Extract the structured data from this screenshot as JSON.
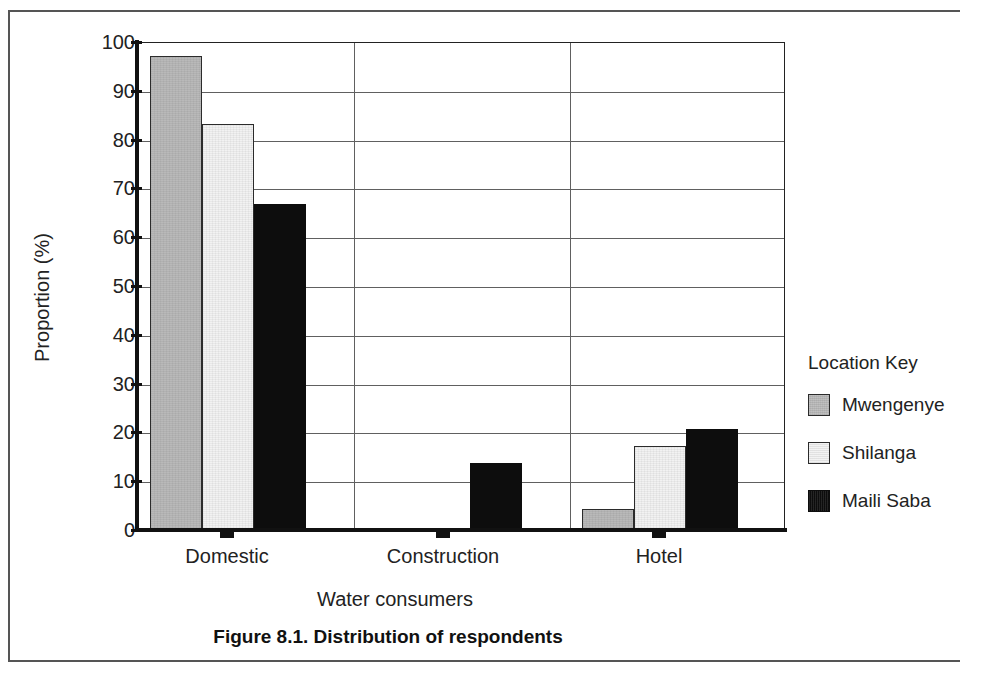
{
  "figure": {
    "caption": "Figure 8.1. Distribution of respondents"
  },
  "chart_data": {
    "type": "bar",
    "title": "",
    "xlabel": "Water consumers",
    "ylabel": "Proportion (%)",
    "categories": [
      "Domestic",
      "Construction",
      "Hotel"
    ],
    "ylim": [
      0,
      100
    ],
    "yticks": [
      0,
      10,
      20,
      30,
      40,
      50,
      60,
      70,
      80,
      90,
      100
    ],
    "ytick_labels": [
      "0",
      "10",
      "20",
      "30",
      "40",
      "50",
      "60",
      "70",
      "80",
      "90",
      "100"
    ],
    "grid": true,
    "legend_position": "right",
    "legend_title": "Location Key",
    "series": [
      {
        "name": "Mwengenye",
        "color": "#b9b9b9",
        "values": [
          97,
          0,
          4
        ]
      },
      {
        "name": "Shilanga",
        "color": "#f2f2f2",
        "values": [
          83,
          0,
          17
        ]
      },
      {
        "name": "Maili Saba",
        "color": "#0d0d0d",
        "values": [
          66.5,
          13.5,
          20.5
        ]
      }
    ]
  }
}
